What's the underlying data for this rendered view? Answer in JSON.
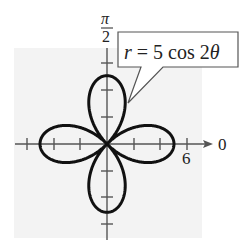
{
  "chart_data": {
    "type": "line",
    "subtype": "polar-rose",
    "title": "",
    "equation": "r = 5 cos 2θ",
    "equation_parts": {
      "lhs": "r",
      "eq": "=",
      "rhs_num": "5 cos 2",
      "theta": "θ"
    },
    "function": {
      "amplitude": 5,
      "frequency": 2,
      "kind": "cos"
    },
    "petals": 4,
    "petal_length": 5,
    "petal_directions_radians": [
      "0",
      "π/2",
      "π",
      "3π/2"
    ],
    "axis_labels": {
      "polar_axis": "0",
      "vertical_top_num": "π",
      "vertical_top_den": "2"
    },
    "tick_labels": [
      {
        "value": 6,
        "label": "6",
        "axis": "polar"
      }
    ],
    "tick_spacing": 2,
    "ticks_per_side": 3,
    "r_range": [
      0,
      6
    ],
    "grid": false,
    "background": "#f2f2f2",
    "curve_color": "#111111",
    "axis_color": "#555555"
  },
  "callout": {
    "text_r": "r",
    "text_eq": " = 5 cos 2",
    "text_theta": "θ"
  }
}
